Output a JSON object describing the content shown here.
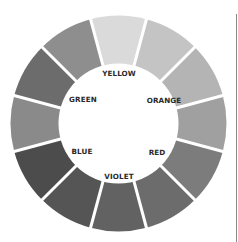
{
  "diagram": {
    "type": "color-wheel",
    "center": {
      "x": 118.5,
      "y": 123.5
    },
    "outer_radius": 108,
    "inner_radius": 60,
    "gap_color": "#ffffff",
    "gap_width": 3,
    "segments": [
      {
        "index": 0,
        "color": "#dadada"
      },
      {
        "index": 1,
        "color": "#c4c4c4"
      },
      {
        "index": 2,
        "color": "#b4b4b4"
      },
      {
        "index": 3,
        "color": "#a0a0a0"
      },
      {
        "index": 4,
        "color": "#7c7c7c"
      },
      {
        "index": 5,
        "color": "#6c6c6c"
      },
      {
        "index": 6,
        "color": "#626262"
      },
      {
        "index": 7,
        "color": "#555555"
      },
      {
        "index": 8,
        "color": "#4c4c4c"
      },
      {
        "index": 9,
        "color": "#8a8a8a"
      },
      {
        "index": 10,
        "color": "#6c6c6c"
      },
      {
        "index": 11,
        "color": "#8e8e8e"
      }
    ],
    "labels": [
      {
        "text": "YELLOW",
        "x": 119,
        "y": 76
      },
      {
        "text": "ORANGE",
        "x": 164,
        "y": 103
      },
      {
        "text": "RED",
        "x": 157,
        "y": 155
      },
      {
        "text": "VIOLET",
        "x": 119,
        "y": 179
      },
      {
        "text": "BLUE",
        "x": 82,
        "y": 154
      },
      {
        "text": "GREEN",
        "x": 83,
        "y": 102
      }
    ]
  }
}
